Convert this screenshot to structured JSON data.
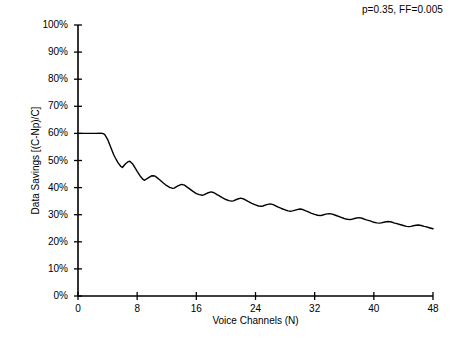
{
  "chart_data": {
    "type": "line",
    "title": "",
    "annotation": "p=0.35, FF=0.005",
    "xlabel": "Voice Channels (N)",
    "ylabel": "Data Savings [(C-Np)/C]",
    "xlim": [
      0,
      48
    ],
    "ylim": [
      0,
      1.0
    ],
    "xticks": [
      0,
      8,
      16,
      24,
      32,
      40,
      48
    ],
    "xtick_labels": [
      "0",
      "8",
      "16",
      "24",
      "32",
      "40",
      "48"
    ],
    "yticks": [
      0,
      0.1,
      0.2,
      0.3,
      0.4,
      0.5,
      0.6,
      0.7,
      0.8,
      0.9,
      1.0
    ],
    "ytick_labels": [
      "0%",
      "10%",
      "20%",
      "30%",
      "40%",
      "50%",
      "60%",
      "70%",
      "80%",
      "90%",
      "100%"
    ],
    "grid": false,
    "legend": false,
    "line_color": "#000000",
    "line_width": 1.4,
    "series": [
      {
        "name": "Data Savings",
        "x": [
          0.0,
          0.5,
          1.0,
          1.5,
          2.0,
          2.5,
          3.0,
          3.3,
          3.6,
          4.0,
          4.4,
          4.8,
          5.0,
          5.4,
          5.8,
          6.0,
          6.4,
          6.8,
          7.0,
          7.4,
          7.8,
          8.0,
          8.4,
          8.8,
          9.0,
          9.5,
          10.0,
          10.4,
          10.8,
          11.0,
          11.5,
          12.0,
          12.4,
          12.8,
          13.0,
          13.5,
          14.0,
          14.4,
          14.8,
          15.0,
          15.5,
          16.0,
          16.4,
          16.8,
          17.0,
          17.5,
          18.0,
          18.4,
          18.8,
          19.0,
          19.5,
          20.0,
          20.4,
          20.8,
          21.0,
          21.5,
          22.0,
          22.4,
          22.8,
          23.0,
          23.5,
          24.0,
          24.4,
          24.8,
          25.0,
          25.5,
          26.0,
          26.4,
          26.8,
          27.0,
          27.5,
          28.0,
          28.4,
          28.8,
          29.0,
          29.5,
          30.0,
          30.4,
          30.8,
          31.0,
          31.5,
          32.0,
          32.4,
          32.8,
          33.0,
          33.5,
          34.0,
          34.4,
          34.8,
          35.0,
          35.5,
          36.0,
          36.4,
          36.8,
          37.0,
          37.5,
          38.0,
          38.4,
          38.8,
          39.0,
          39.5,
          40.0,
          40.4,
          40.8,
          41.0,
          41.5,
          42.0,
          42.4,
          42.8,
          43.0,
          43.5,
          44.0,
          44.4,
          44.8,
          45.0,
          45.5,
          46.0,
          46.4,
          46.8,
          47.0,
          47.5,
          48.0
        ],
        "y": [
          0.6,
          0.6,
          0.6,
          0.6,
          0.6,
          0.6,
          0.601,
          0.6,
          0.596,
          0.578,
          0.551,
          0.523,
          0.512,
          0.492,
          0.478,
          0.474,
          0.487,
          0.496,
          0.497,
          0.487,
          0.469,
          0.46,
          0.443,
          0.43,
          0.427,
          0.436,
          0.444,
          0.443,
          0.434,
          0.43,
          0.418,
          0.407,
          0.401,
          0.397,
          0.398,
          0.406,
          0.412,
          0.409,
          0.401,
          0.397,
          0.387,
          0.378,
          0.374,
          0.372,
          0.373,
          0.38,
          0.384,
          0.381,
          0.374,
          0.371,
          0.363,
          0.356,
          0.352,
          0.35,
          0.351,
          0.357,
          0.361,
          0.358,
          0.352,
          0.349,
          0.342,
          0.336,
          0.332,
          0.331,
          0.332,
          0.337,
          0.34,
          0.337,
          0.332,
          0.329,
          0.323,
          0.318,
          0.314,
          0.313,
          0.314,
          0.318,
          0.321,
          0.319,
          0.314,
          0.312,
          0.306,
          0.301,
          0.298,
          0.297,
          0.298,
          0.302,
          0.304,
          0.302,
          0.298,
          0.296,
          0.291,
          0.286,
          0.283,
          0.282,
          0.283,
          0.287,
          0.289,
          0.287,
          0.283,
          0.281,
          0.277,
          0.272,
          0.27,
          0.269,
          0.27,
          0.273,
          0.275,
          0.273,
          0.269,
          0.268,
          0.264,
          0.26,
          0.257,
          0.256,
          0.257,
          0.26,
          0.262,
          0.26,
          0.257,
          0.256,
          0.252,
          0.248
        ]
      }
    ]
  }
}
